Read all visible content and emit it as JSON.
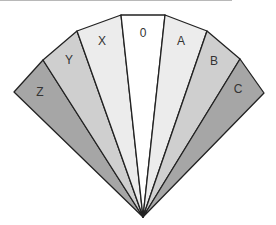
{
  "diagram": {
    "type": "fan",
    "apex": [
      143,
      217
    ],
    "segments": [
      {
        "label": "Z",
        "color": "#a6a6a6",
        "outer": [
          [
            14,
            92
          ],
          [
            43,
            60
          ]
        ],
        "label_pos": [
          40,
          93
        ]
      },
      {
        "label": "Y",
        "color": "#cfcfcf",
        "outer": [
          [
            43,
            60
          ],
          [
            77,
            31
          ]
        ],
        "label_pos": [
          69,
          61
        ]
      },
      {
        "label": "X",
        "color": "#ececec",
        "outer": [
          [
            77,
            31
          ],
          [
            121,
            15
          ]
        ],
        "label_pos": [
          102,
          42
        ]
      },
      {
        "label": "0",
        "color": "#ffffff",
        "outer": [
          [
            121,
            15
          ],
          [
            165,
            15
          ]
        ],
        "label_pos": [
          143,
          34
        ]
      },
      {
        "label": "A",
        "color": "#ececec",
        "outer": [
          [
            165,
            15
          ],
          [
            207,
            31
          ]
        ],
        "label_pos": [
          181,
          42
        ]
      },
      {
        "label": "B",
        "color": "#cfcfcf",
        "outer": [
          [
            207,
            31
          ],
          [
            240,
            59
          ]
        ],
        "label_pos": [
          214,
          62
        ]
      },
      {
        "label": "C",
        "color": "#a6a6a6",
        "outer": [
          [
            240,
            59
          ],
          [
            264,
            93
          ]
        ],
        "label_pos": [
          238,
          90
        ]
      }
    ]
  }
}
